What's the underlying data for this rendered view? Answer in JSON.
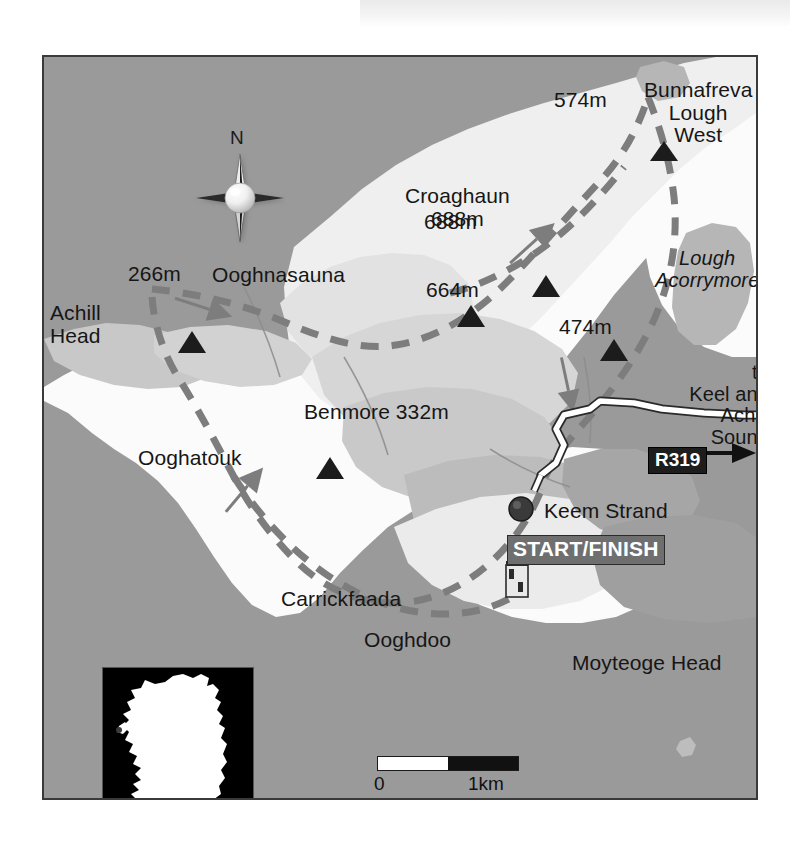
{
  "map": {
    "title": "Achill Head / Croaghaun walking route map",
    "region": "Achill Island, County Mayo, Ireland",
    "frame": {
      "x": 42,
      "y": 55,
      "width": 716,
      "height": 745,
      "border_color": "#3a3a3a"
    },
    "colors": {
      "sea_land_base": "#9a9a9a",
      "mid_slope": "#c3c3c3",
      "upper_slope": "#d8d8d8",
      "high_ground": "#f2f2f2",
      "lowland_white": "#fbfbfb",
      "lough_shade": "#b5b5b5",
      "trail_dash": "#7d7d7d",
      "road_casing": "#2a2a2a",
      "road_fill": "#ffffff",
      "text": "#161616",
      "startfinish_bg": "#6f6f6f",
      "road_badge_bg": "#1d1d1d"
    },
    "compass": {
      "label": "N",
      "name": "compass-rose-north"
    },
    "scale_bar": {
      "min_label": "0",
      "max_label": "1km",
      "segments": 2,
      "unit": "km"
    },
    "inset": {
      "name": "ireland-locator-inset",
      "land_color": "#ffffff",
      "sea_color": "#000000"
    }
  },
  "labels": {
    "places": [
      {
        "id": "ooghnasauna",
        "text": "Ooghnasauna",
        "x": 168,
        "y": 217,
        "style": "place"
      },
      {
        "id": "achill_head",
        "text": "Achill\nHead",
        "x": 46,
        "y": 255,
        "style": "place"
      },
      {
        "id": "ooghatouk",
        "text": "Ooghatouk",
        "x": 134,
        "y": 400,
        "style": "place"
      },
      {
        "id": "carrickfaada",
        "text": "Carrickfaada",
        "x": 277,
        "y": 541,
        "style": "place"
      },
      {
        "id": "ooghdoo",
        "text": "Ooghdoo",
        "x": 360,
        "y": 582,
        "style": "place"
      },
      {
        "id": "moyteoge_head",
        "text": "Moyteoge Head",
        "x": 568,
        "y": 605,
        "style": "place"
      },
      {
        "id": "keem_strand",
        "text": "Keem Strand",
        "x": 540,
        "y": 500,
        "style": "place"
      },
      {
        "id": "bunnafreva_lough_west",
        "text": "Bunnafreva\nLough\nWest",
        "x": 640,
        "y": 66,
        "style": "place"
      },
      {
        "id": "croaghaun",
        "text": "Croaghaun\n688m",
        "x": 401,
        "y": 182,
        "style": "place"
      }
    ],
    "water": [
      {
        "id": "lough_acorrymore",
        "text": "Lough\nAcorrymore",
        "x": 651,
        "y": 243,
        "style": "water"
      }
    ],
    "direction": [
      {
        "id": "to_keel_achill_sound",
        "text": "to\nKeel and\nAchill\nSound",
        "x": 667,
        "y": 355,
        "style": "direction"
      }
    ],
    "route_marker": {
      "id": "start_finish",
      "text": "START/FINISH",
      "x": 505,
      "y": 528
    },
    "road_badge": {
      "id": "r319",
      "text": "R319",
      "x": 646,
      "y": 448
    }
  },
  "summits": [
    {
      "id": "peak-574",
      "label": "574m",
      "elevation_m": 574,
      "label_x": 552,
      "label_y": 84,
      "marker_x": 620,
      "marker_y": 92
    },
    {
      "id": "peak-688",
      "label": "688m",
      "elevation_m": 688,
      "label_x": 424,
      "label_y": 206,
      "marker_x": 502,
      "marker_y": 228,
      "name": "Croaghaun"
    },
    {
      "id": "peak-664",
      "label": "664m",
      "elevation_m": 664,
      "label_x": 424,
      "label_y": 274,
      "marker_x": 427,
      "marker_y": 258
    },
    {
      "id": "peak-474",
      "label": "474m",
      "elevation_m": 474,
      "label_x": 557,
      "label_y": 311,
      "marker_x": 570,
      "marker_y": 292
    },
    {
      "id": "peak-266",
      "label": "266m",
      "elevation_m": 266,
      "label_x": 126,
      "label_y": 258,
      "marker_x": 148,
      "marker_y": 283
    },
    {
      "id": "peak-332",
      "label": "Benmore 332m",
      "elevation_m": 332,
      "label_x": 302,
      "label_y": 396,
      "marker_x": 286,
      "marker_y": 410
    }
  ],
  "legend_features": [
    {
      "name": "walking-route-dashed-line",
      "description": "Dashed grey line showing the circular walking route"
    },
    {
      "name": "direction-arrow",
      "description": "Arrowheads along the route showing direction of travel"
    },
    {
      "name": "start-finish-marker",
      "description": "Filled circle at Keem Strand car park"
    },
    {
      "name": "signal-tower-icon",
      "description": "Small tower building symbol near Moyteoge Head"
    },
    {
      "name": "summit-triangle",
      "description": "Black triangle marking a summit spot height"
    }
  ]
}
